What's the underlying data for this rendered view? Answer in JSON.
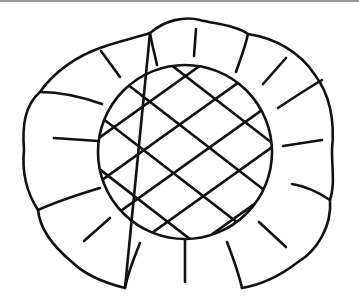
{
  "image": {
    "subject": "sunflower line drawing",
    "description": "Outline of a flower with scalloped petals surrounding a circular crosshatched center",
    "colors": {
      "background": "#ffffff",
      "ink": "#111111",
      "top_border": "#9a9a9a"
    },
    "petal_count": 12,
    "center": {
      "shape": "circle",
      "pattern": "crosshatch"
    }
  }
}
